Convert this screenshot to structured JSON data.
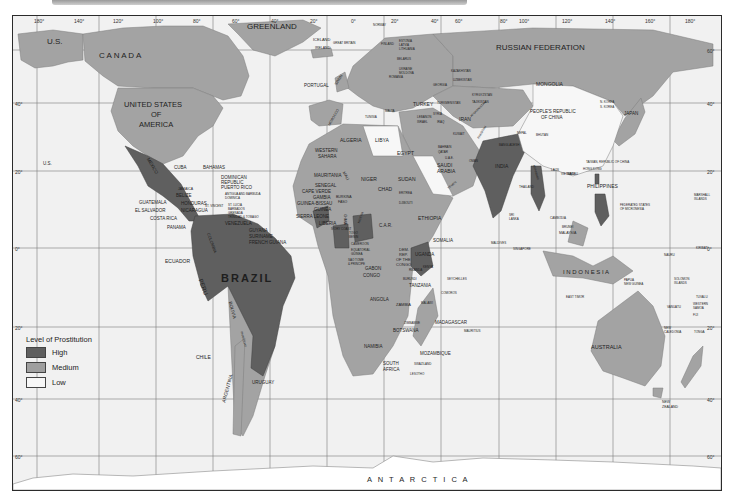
{
  "map": {
    "title_visible": "",
    "colors": {
      "high": "#5f5f5f",
      "medium": "#9f9f9f",
      "low": "#f4f4f4",
      "ocean": "#f1f1f1",
      "grid": "#6f6f6f",
      "border": "#2b2b2b"
    },
    "longitude_ticks": [
      "180°",
      "140°",
      "120°",
      "100°",
      "80°",
      "60°",
      "40°",
      "20°",
      "0°",
      "20°",
      "40°",
      "60°",
      "80°",
      "100°",
      "120°",
      "140°",
      "160°",
      "180°"
    ],
    "latitude_ticks": [
      "60°",
      "40°",
      "20°",
      "0°",
      "20°",
      "40°",
      "60°"
    ],
    "legend": {
      "title": "Level of Prostitution",
      "items": [
        {
          "label": "High",
          "color": "#5f5f5f"
        },
        {
          "label": "Medium",
          "color": "#9f9f9f"
        },
        {
          "label": "Low",
          "color": "#f4f4f4"
        }
      ]
    },
    "labels": {
      "us_alaska": "U.S.",
      "canada": "C A N A D A",
      "greenland": "GREENLAND",
      "iceland": "ICELAND",
      "usa_1": "UNITED STATES",
      "usa_2": "OF",
      "usa_3": "AMERICA",
      "us_hawaii": "U.S.",
      "mexico": "MEXICO",
      "cuba": "CUBA",
      "bahamas": "BAHAMAS",
      "dominican_1": "DOMINICAN",
      "dominican_2": "REPUBLIC",
      "puerto_rico": "PUERTO RICO",
      "jamaica": "JAMAICA",
      "belize": "BELIZE",
      "antigua": "ANTIGUA AND BARBUDA",
      "dominica": "DOMINICA",
      "st_vincent": "ST. VINCENT",
      "st_lucia": "ST. LUCIA",
      "barbados": "BARBADOS",
      "grenada": "GRENADA",
      "trinidad": "TRINIDAD & TOBAGO",
      "guatemala": "GUATEMALA",
      "honduras": "HONDURAS",
      "el_salvador": "EL SALVADOR",
      "nicaragua": "NICARAGUA",
      "costa_rica": "COSTA RICA",
      "panama": "PANAMA",
      "venezuela": "VENEZUELA",
      "guyana": "GUYANA",
      "suriname": "SURINAME",
      "french_guiana": "FRENCH GUIANA",
      "colombia": "COLOMBIA",
      "ecuador": "ECUADOR",
      "peru": "PERU",
      "brazil": "BRAZIL",
      "bolivia": "BOLIVIA",
      "paraguay": "PARAGUAY",
      "chile": "CHILE",
      "argentina": "ARGENTINA",
      "uruguay": "URUGUAY",
      "ireland": "IRELAND",
      "great_britain": "GREAT BRITAIN",
      "portugal": "PORTUGAL",
      "spain": "SPAIN",
      "norway": "NORWAY",
      "finland": "FINLAND",
      "estonia": "ESTONIA",
      "latvia": "LATVIA",
      "lithuania": "LITHUANIA",
      "belarus": "BELARUS",
      "ukraine": "UKRAINE",
      "moldova": "MOLDOVA",
      "romania": "ROMANIA",
      "georgia": "GEORGIA",
      "turkey": "TURKEY",
      "malta": "MALTA",
      "tunisia": "TUNISIA",
      "morocco": "MOROCCO",
      "algeria": "ALGERIA",
      "libya": "LIBYA",
      "egypt": "EGYPT",
      "syria": "SYRIA",
      "lebanon": "LEBANON",
      "israel": "ISRAEL",
      "iraq": "IRAQ",
      "iran": "IRAN",
      "kuwait": "KUWAIT",
      "bahrain": "BAHRAIN",
      "qatar": "QATAR",
      "uae": "U.A.E.",
      "oman": "OMAN",
      "saudi_1": "SAUDI",
      "saudi_2": "ARABIA",
      "yemen": "YEMEN",
      "western_sahara_1": "WESTERN",
      "western_sahara_2": "SAHARA",
      "mauritania": "MAURITANIA",
      "senegal": "SENEGAL",
      "cape_verde": "CAPE VERDE",
      "gambia": "GAMBIA",
      "guinea_bissau": "GUINEA-BISSAU",
      "guinea": "GUINEA",
      "sierra_leone": "SIERRA LEONE",
      "liberia": "LIBERIA",
      "ivory_coast": "IVORY COAST",
      "mali": "MALI",
      "burkina_1": "BURKINA",
      "burkina_2": "FASO",
      "ghana": "GHANA",
      "togo": "TOGO",
      "benin": "BENIN",
      "niger": "NIGER",
      "nigeria": "NIGERIA",
      "chad": "CHAD",
      "sudan": "SUDAN",
      "eritrea": "ERITREA",
      "djibouti": "DJIBOUTI",
      "ethiopia": "ETHIOPIA",
      "somalia": "SOMALIA",
      "car": "C.A.R.",
      "cameroon": "CAMEROON",
      "equatorial_guinea_1": "EQUATORIAL",
      "equatorial_guinea_2": "GUINEA",
      "sao_tome_1": "SAO TOME",
      "sao_tome_2": "& PRINCIPE",
      "gabon": "GABON",
      "congo": "CONGO",
      "drc_1": "DEM.",
      "drc_2": "REP.",
      "drc_3": "OF THE",
      "drc_4": "CONGO",
      "uganda": "UGANDA",
      "kenya": "KENYA",
      "rwanda": "RWANDA",
      "burundi": "BURUNDI",
      "tanzania": "TANZANIA",
      "seychelles": "SEYCHELLES",
      "comoros": "COMOROS",
      "angola": "ANGOLA",
      "zambia": "ZAMBIA",
      "malawi": "MALAWI",
      "zimbabwe": "ZIMBABWE",
      "botswana": "BOTSWANA",
      "namibia": "NAMIBIA",
      "mozambique": "MOZAMBIQUE",
      "madagascar": "MADAGASCAR",
      "mauritius": "MAURITIUS",
      "swaziland": "SWAZILAND",
      "lesotho": "LESOTHO",
      "south_africa_1": "SOUTH",
      "south_africa_2": "AFRICA",
      "russia": "RUSSIAN FEDERATION",
      "kazakhstan": "KAZAKHSTAN",
      "uzbekistan": "UZBEKISTAN",
      "turkmenistan": "TURKMENISTAN",
      "kyrgyzstan": "KYRGYZSTAN",
      "tajikistan": "TAJIKISTAN",
      "afghanistan": "AFGHANISTAN",
      "pakistan": "PAKISTAN",
      "mongolia": "MONGOLIA",
      "china_1": "PEOPLE'S REPUBLIC",
      "china_2": "OF CHINA",
      "nepal": "NEPAL",
      "bhutan": "BHUTAN",
      "bangladesh": "BANGLADESH",
      "india": "INDIA",
      "sri_lanka_1": "SRI",
      "sri_lanka_2": "LANKA",
      "maldives": "MALDIVES",
      "myanmar": "MYANMAR",
      "thailand": "THAILAND",
      "laos": "LAOS",
      "vietnam": "VIETNAM",
      "cambodia": "CAMBODIA",
      "north_korea": "N. KOREA",
      "south_korea": "S. KOREA",
      "japan": "JAPAN",
      "taiwan": "TAIWAN, REPUBLIC OF CHINA",
      "hong_kong": "HONG KONG",
      "macau": "MACAU",
      "philippines": "PHILIPPINES",
      "brunei": "BRUNEI",
      "malaysia": "MALAYSIA",
      "singapore": "SINGAPORE",
      "indonesia": "I N D O N E S I A",
      "east_timor": "EAST TIMOR",
      "png_1": "PAPUA",
      "png_2": "NEW GUINEA",
      "micronesia_1": "FEDERATED STATES",
      "micronesia_2": "OF MICRONESIA",
      "marshall_1": "MARSHALL",
      "marshall_2": "ISLANDS",
      "nauru": "NAURU",
      "kiribati": "KIRIBATI",
      "solomon_1": "SOLOMON",
      "solomon_2": "ISLANDS",
      "tuvalu": "TUVALU",
      "vanuatu": "VANUATU",
      "western_samoa_1": "WESTERN",
      "western_samoa_2": "SAMOA",
      "fiji": "FIJI",
      "tonga": "TONGA",
      "new_caledonia_1": "NEW",
      "new_caledonia_2": "CALEDONIA",
      "australia": "AUSTRALIA",
      "new_zealand_1": "NEW",
      "new_zealand_2": "ZEALAND",
      "antarctica": "A N T A R C T I C A"
    }
  }
}
